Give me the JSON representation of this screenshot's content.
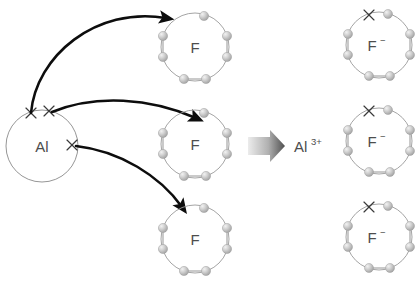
{
  "diagram": {
    "background_color": "#ffffff",
    "reactants": {
      "metal": {
        "symbol": "Al",
        "name": "aluminium-atom",
        "valence_electron_marks": 3,
        "mark_glyph": "x",
        "circle": {
          "cx": 42,
          "cy": 146,
          "r": 36
        },
        "marks": [
          {
            "name": "al-electron-1",
            "x": 31,
            "y": 113
          },
          {
            "name": "al-electron-2",
            "x": 49,
            "y": 111
          },
          {
            "name": "al-electron-3",
            "x": 72,
            "y": 145
          }
        ]
      },
      "nonmetals": [
        {
          "symbol": "F",
          "name": "fluorine-atom-top",
          "electron_count": 7,
          "circle": {
            "cx": 195,
            "cy": 47,
            "r": 34
          }
        },
        {
          "symbol": "F",
          "name": "fluorine-atom-middle",
          "electron_count": 7,
          "circle": {
            "cx": 195,
            "cy": 144,
            "r": 34
          }
        },
        {
          "symbol": "F",
          "name": "fluorine-atom-bottom",
          "electron_count": 7,
          "circle": {
            "cx": 195,
            "cy": 239,
            "r": 34
          }
        }
      ]
    },
    "products": {
      "cation": {
        "symbol": "Al",
        "charge": "3+",
        "name": "aluminium-ion",
        "electron_count": 0,
        "position": {
          "x": 293,
          "y": 150
        }
      },
      "anions": [
        {
          "symbol": "F",
          "charge": "−",
          "name": "fluoride-ion-top",
          "electron_count": 7,
          "gained_electron_marks": 1,
          "circle": {
            "cx": 379,
            "cy": 45,
            "r": 33
          },
          "mark": {
            "x": 370,
            "y": 14
          }
        },
        {
          "symbol": "F",
          "charge": "−",
          "name": "fluoride-ion-middle",
          "electron_count": 7,
          "gained_electron_marks": 1,
          "circle": {
            "cx": 379,
            "cy": 141,
            "r": 33
          },
          "mark": {
            "x": 370,
            "y": 110
          }
        },
        {
          "symbol": "F",
          "charge": "−",
          "name": "fluoride-ion-bottom",
          "electron_count": 7,
          "gained_electron_marks": 1,
          "circle": {
            "cx": 379,
            "cy": 237,
            "r": 33
          },
          "mark": {
            "x": 370,
            "y": 206
          }
        }
      ]
    },
    "reaction_arrow": {
      "name": "reaction-arrow",
      "direction": "right",
      "style": "block-gradient",
      "color_start": "#e8e8e8",
      "color_end": "#585858"
    },
    "transfer_arrows": [
      {
        "name": "electron-transfer-arrow-1",
        "from": "Al",
        "to": "F top"
      },
      {
        "name": "electron-transfer-arrow-2",
        "from": "Al",
        "to": "F middle"
      },
      {
        "name": "electron-transfer-arrow-3",
        "from": "Al",
        "to": "F bottom"
      }
    ],
    "colors": {
      "electron_sphere": "#c9c9c9",
      "electron_sphere_edge": "#9e9e9e",
      "ring_stroke": "#9a9a9a",
      "label_text": "#4d4d4d",
      "arrow_black": "#0d0d0d"
    }
  }
}
